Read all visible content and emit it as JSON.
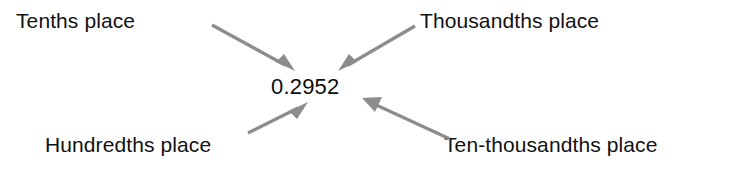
{
  "figure": {
    "type": "place-value-callout-diagram",
    "background_color": "#ffffff",
    "text_color": "#111111",
    "arrow_color": "#8c8c8c",
    "center_value": "0.2952",
    "labels": {
      "tenths": "Tenths place",
      "thousandths": "Thousandths place",
      "hundredths": "Hundredths place",
      "ten_thousandths": "Ten-thousandths place"
    },
    "arrows": [
      {
        "name": "arrow-tenths",
        "from_label": "Tenths place",
        "points_to_digit": "2",
        "start": [
          212,
          25
        ],
        "end": [
          293,
          69
        ],
        "direction": "down-right"
      },
      {
        "name": "arrow-thousandths",
        "from_label": "Thousandths place",
        "points_to_digit": "5",
        "start": [
          415,
          26
        ],
        "end": [
          340,
          69
        ],
        "direction": "down-left"
      },
      {
        "name": "arrow-hundredths",
        "from_label": "Hundredths place",
        "points_to_digit": "9",
        "start": [
          248,
          133
        ],
        "end": [
          306,
          103
        ],
        "direction": "up-right"
      },
      {
        "name": "arrow-ten-thousandths",
        "from_label": "Ten-thousandths place",
        "points_to_digit": "2",
        "start": [
          450,
          139
        ],
        "end": [
          364,
          99
        ],
        "direction": "up-left"
      }
    ]
  }
}
